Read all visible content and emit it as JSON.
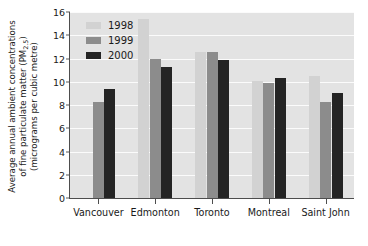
{
  "chart_data": {
    "type": "bar",
    "title": "",
    "xlabel": "",
    "ylabel_lines": [
      "Average annual ambient concentrations",
      "of fine particulate matter (PM2.5)",
      "(micrograms per cubic metre)"
    ],
    "ylabel_full": "Average annual ambient concentrations of fine particulate matter (PM2.5) (micrograms per cubic metre)",
    "categories": [
      "Vancouver",
      "Edmonton",
      "Toronto",
      "Montreal",
      "Saint John"
    ],
    "series": [
      {
        "name": "1998",
        "color": "#d2d2d2",
        "values": [
          null,
          15.4,
          12.6,
          10.1,
          10.5
        ]
      },
      {
        "name": "1999",
        "color": "#8c8c8c",
        "values": [
          8.3,
          12.0,
          12.6,
          9.9,
          8.3
        ]
      },
      {
        "name": "2000",
        "color": "#242424",
        "values": [
          9.4,
          11.3,
          11.9,
          10.3,
          9.0
        ]
      }
    ],
    "ylim": [
      0,
      16
    ],
    "yticks": [
      0,
      2,
      4,
      6,
      8,
      10,
      12,
      14,
      16
    ],
    "ytick_labels": [
      "0",
      "2",
      "4",
      "6",
      "8",
      "10",
      "12",
      "14",
      "16"
    ],
    "grid": true,
    "legend_position": "top-left-inside",
    "plot_background": "#e3e3e3",
    "gridline_color": "#fbfbfb",
    "axis_color": "#4d4d4d"
  },
  "legend": {
    "entries": [
      {
        "label": "1998"
      },
      {
        "label": "1999"
      },
      {
        "label": "2000"
      }
    ]
  }
}
